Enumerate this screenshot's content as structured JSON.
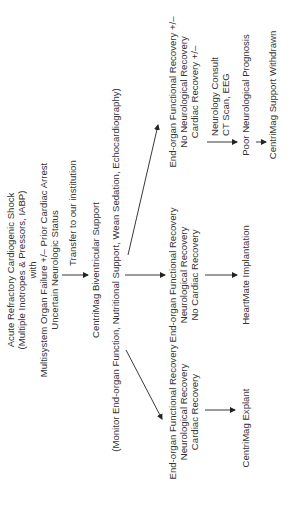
{
  "diagram": {
    "title_block": {
      "lines": [
        "Acute Refractory Cardiogenic Shock",
        "(Multiple Inotropes & Pressors, IABP)",
        "with",
        "Multisystem Organ Failure +/– Prior Cardiac Arrest",
        "Uncertain Neurologic Status"
      ]
    },
    "transfer_label": "Transfer to our institution",
    "support_node": "CentriMag Biventricular Support",
    "monitor_note": "(Monitor End-organ Function, Nutritional Support, Wean Sedation, Echocardiography)",
    "branches": [
      {
        "lines": [
          "End-organ Functional Recovery",
          "Neurological Recovery",
          "Cardiac Recovery"
        ],
        "outcome": "CentriMag Explant"
      },
      {
        "lines": [
          "End-organ Functional Recovery",
          "Neurological Recovery",
          "No Cardiac Recovery"
        ],
        "outcome": "HeartMate Implantation"
      },
      {
        "lines": [
          "End-organ Functional Recovery +/–",
          "No Neurological Recovery",
          "Cardiac Recovery +/–"
        ],
        "workup": [
          "Neurology Consult",
          "CT Scan, EEG"
        ],
        "outcome": "Poor Neurological Prognosis",
        "final": "CentriMag Support Withdrawn"
      }
    ],
    "orientation": "rotated 90 degrees counter-clockwise"
  }
}
